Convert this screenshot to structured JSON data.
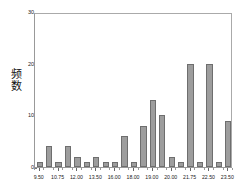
{
  "chart_data": {
    "type": "bar",
    "title": "",
    "subtitle": "",
    "xlabel": "",
    "ylabel": "频数",
    "ylabel_chars": [
      "频",
      "数"
    ],
    "ylim": [
      0,
      30
    ],
    "yticks": [
      0,
      10,
      20,
      30
    ],
    "ytick_labels": [
      "0",
      "10",
      "20",
      "30"
    ],
    "xtick_labels": [
      "9.50",
      "10.75",
      "12.00",
      "13.50",
      "16.00",
      "18.00",
      "19.00",
      "20.00",
      "21.75",
      "22.50",
      "23.50"
    ],
    "xtick_positions": [
      0,
      2,
      4,
      6,
      8,
      10,
      12,
      14,
      16,
      18,
      20
    ],
    "grid": false,
    "legend": null,
    "bar_color": "#9d9d9d",
    "bar_edge_color": "#6e6e6e",
    "frame_color": "#999999",
    "background": "#ffffff",
    "n_bins": 21,
    "categories": [
      "9.50",
      "10.25",
      "10.75",
      "11.50",
      "12.00",
      "12.75",
      "13.50",
      "14.25",
      "16.00",
      "17.00",
      "18.00",
      "18.50",
      "19.00",
      "19.50",
      "20.00",
      "21.00",
      "21.75",
      "22.25",
      "22.50",
      "23.00",
      "23.50"
    ],
    "values": [
      1,
      4,
      1,
      4,
      2,
      1,
      2,
      1,
      1,
      6,
      1,
      8,
      13,
      10,
      2,
      1,
      20,
      1,
      20,
      1,
      9
    ]
  }
}
